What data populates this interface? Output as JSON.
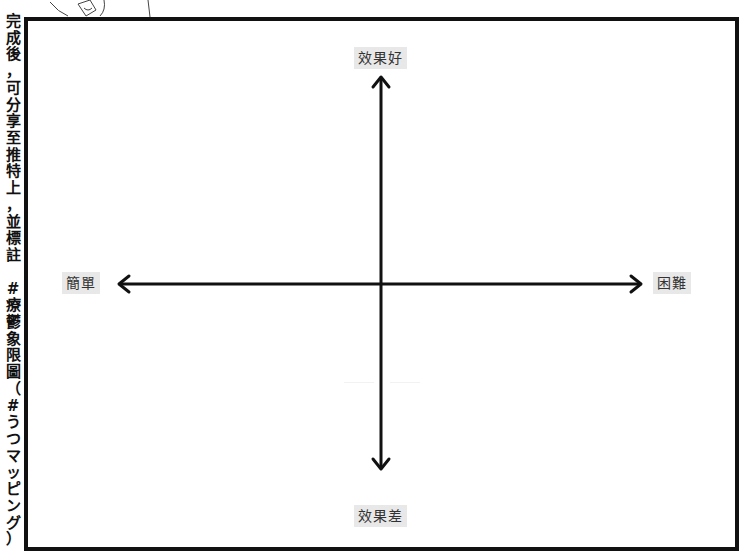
{
  "side_caption": {
    "text": "完成後，可分享至推特上，並標註 #療鬱象限圖（#うつマッピング）",
    "chars": [
      "完",
      "成",
      "後",
      "，",
      "可",
      "分",
      "享",
      "至",
      "推",
      "特",
      "上",
      "，",
      "並",
      "標",
      "註",
      "",
      "#",
      "療",
      "鬱",
      "象",
      "限",
      "圖",
      "（",
      "#",
      "う",
      "つ",
      "マ",
      "ッ",
      "ピ",
      "ン",
      "グ",
      "）"
    ]
  },
  "quadrant": {
    "y_axis": {
      "top_label": "效果好",
      "bottom_label": "效果差"
    },
    "x_axis": {
      "left_label": "簡單",
      "right_label": "困難"
    }
  },
  "colors": {
    "frame": "#111111",
    "axis": "#111111",
    "label_bg": "#e8e8e8",
    "label_text": "#333333"
  }
}
